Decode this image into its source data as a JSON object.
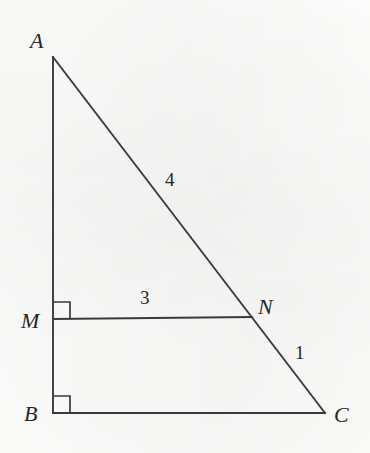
{
  "figure": {
    "kind": "geometry-diagram",
    "background_color": "#fcfcfb",
    "stroke_color": "#3a3a3a",
    "label_color": "#262626",
    "canvas": {
      "width": 370,
      "height": 453
    }
  },
  "points": [
    {
      "id": "A",
      "label": "A",
      "x": 53,
      "y": 57,
      "label_x": 30,
      "label_y": 30
    },
    {
      "id": "B",
      "label": "B",
      "x": 53,
      "y": 413,
      "label_x": 24,
      "label_y": 403
    },
    {
      "id": "C",
      "label": "C",
      "x": 325,
      "y": 413,
      "label_x": 334,
      "label_y": 404
    },
    {
      "id": "M",
      "label": "M",
      "x": 53,
      "y": 320,
      "label_x": 21,
      "label_y": 310
    },
    {
      "id": "N",
      "label": "N",
      "x": 252,
      "y": 318,
      "label_x": 258,
      "label_y": 296
    }
  ],
  "segments": [
    {
      "id": "AB",
      "from": "A",
      "to": "B",
      "x1": 53,
      "y1": 57,
      "x2": 53,
      "y2": 413
    },
    {
      "id": "BC",
      "from": "B",
      "to": "C",
      "x1": 53,
      "y1": 413,
      "x2": 325,
      "y2": 413
    },
    {
      "id": "AC",
      "from": "A",
      "to": "C",
      "x1": 53,
      "y1": 57,
      "x2": 325,
      "y2": 413
    },
    {
      "id": "MN",
      "from": "M",
      "to": "N",
      "x1": 53,
      "y1": 319,
      "x2": 252,
      "y2": 317
    }
  ],
  "right_angles": [
    {
      "id": "angle-M",
      "at": "M",
      "x": 53,
      "y": 302,
      "size": 17
    },
    {
      "id": "angle-B",
      "at": "B",
      "x": 53,
      "y": 396,
      "size": 17
    }
  ],
  "length_labels": [
    {
      "id": "len-AN",
      "segment": "AN",
      "text": "4",
      "x": 165,
      "y": 170
    },
    {
      "id": "len-MN",
      "segment": "MN",
      "text": "3",
      "x": 140,
      "y": 288
    },
    {
      "id": "len-NC",
      "segment": "NC",
      "text": "1",
      "x": 295,
      "y": 343
    }
  ]
}
